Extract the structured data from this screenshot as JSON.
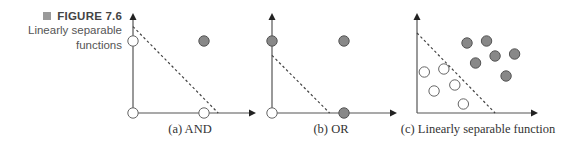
{
  "figure": {
    "number_label": "FIGURE 7.6",
    "marker_icon": "square-bullet-icon",
    "description_lines": [
      "Linearly separable",
      "functions"
    ],
    "colors": {
      "axis": "#555555",
      "dashed_line": "#444444",
      "filled_point": "#888888",
      "filled_point_stroke": "#555555",
      "open_point": "#ffffff",
      "open_point_stroke": "#666666",
      "marker": "#9a9a9a"
    }
  },
  "chart_data": [
    {
      "type": "scatter",
      "title": "(a) AND",
      "caption": "(a) AND",
      "points": [
        {
          "x": 0,
          "y": 0,
          "class": "open"
        },
        {
          "x": 1,
          "y": 0,
          "class": "open"
        },
        {
          "x": 0,
          "y": 1,
          "class": "open"
        },
        {
          "x": 1,
          "y": 1,
          "class": "filled"
        }
      ],
      "separator": {
        "x_intercept": 1.2,
        "y_intercept": 1.2
      },
      "xlim": [
        0,
        1.8
      ],
      "ylim": [
        0,
        1.4
      ]
    },
    {
      "type": "scatter",
      "title": "(b) OR",
      "caption": "(b) OR",
      "points": [
        {
          "x": 0,
          "y": 0,
          "class": "open"
        },
        {
          "x": 1,
          "y": 0,
          "class": "filled"
        },
        {
          "x": 0,
          "y": 1,
          "class": "filled"
        },
        {
          "x": 1,
          "y": 1,
          "class": "filled"
        }
      ],
      "separator": {
        "x_intercept": 0.8,
        "y_intercept": 0.8
      },
      "xlim": [
        0,
        1.75
      ],
      "ylim": [
        0,
        1.4
      ]
    },
    {
      "type": "scatter",
      "title": "(c) Linearly separable function",
      "caption": "(c) Linearly separable function",
      "points": [
        {
          "x": 0.41,
          "y": 0.7,
          "class": "filled"
        },
        {
          "x": 0.57,
          "y": 0.72,
          "class": "filled"
        },
        {
          "x": 0.64,
          "y": 0.57,
          "class": "filled"
        },
        {
          "x": 0.8,
          "y": 0.59,
          "class": "filled"
        },
        {
          "x": 0.48,
          "y": 0.5,
          "class": "filled"
        },
        {
          "x": 0.73,
          "y": 0.37,
          "class": "filled"
        },
        {
          "x": 0.06,
          "y": 0.41,
          "class": "open"
        },
        {
          "x": 0.22,
          "y": 0.44,
          "class": "open"
        },
        {
          "x": 0.31,
          "y": 0.28,
          "class": "open"
        },
        {
          "x": 0.14,
          "y": 0.22,
          "class": "open"
        },
        {
          "x": 0.38,
          "y": 0.09,
          "class": "open"
        }
      ],
      "separator": {
        "x_intercept": 0.64,
        "y_intercept": 0.8
      },
      "xlim": [
        0,
        1.0
      ],
      "ylim": [
        0,
        1.0
      ]
    }
  ]
}
